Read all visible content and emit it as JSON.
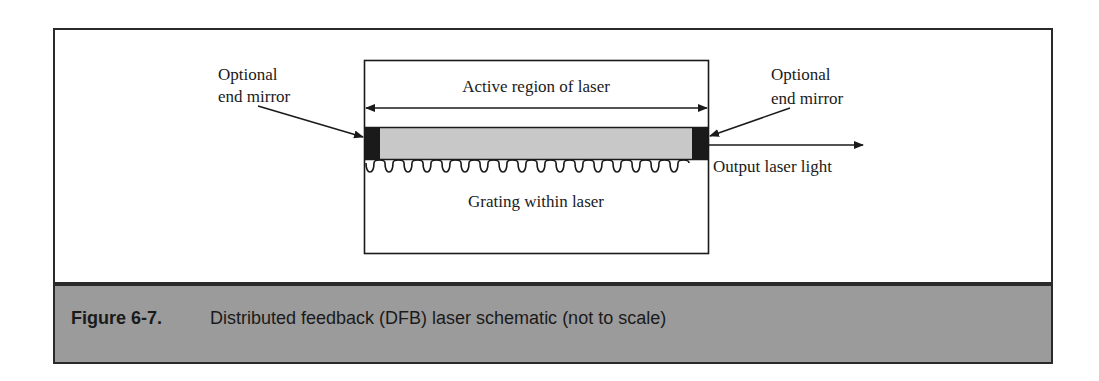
{
  "diagram": {
    "labels": {
      "left_mirror_line1": "Optional",
      "left_mirror_line2": "end mirror",
      "right_mirror_line1": "Optional",
      "right_mirror_line2": "end mirror",
      "active_region": "Active region of laser",
      "grating": "Grating within laser",
      "output": "Output laser light"
    },
    "colors": {
      "active_region_fill": "#c8c8c8",
      "mirror_fill": "#1a1a1a",
      "line": "#1a1a1a",
      "caption_bg": "#9b9b9b"
    }
  },
  "caption": {
    "number": "Figure 6-7.",
    "text": "Distributed feedback (DFB) laser schematic (not to scale)"
  }
}
